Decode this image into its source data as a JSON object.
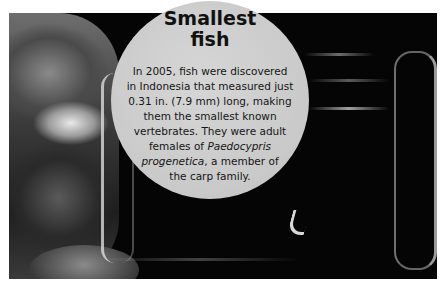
{
  "callout": {
    "title_line1": "Smallest",
    "title_line2": "fish",
    "body": [
      "In 2005, fish were discovered",
      "in Indonesia that measured just",
      "0.31 in. (7.9 mm) long, making",
      "them the smallest known",
      "vertebrates. They were adult",
      "females of ",
      "Paedocypris",
      "progenetica",
      ", a member of",
      "the carp family."
    ]
  },
  "photo": {
    "subject": "hand holding a glass jar containing a tiny fish",
    "colors": {
      "background": "#050505",
      "circle": "#cfcfcf",
      "text": "#111111"
    }
  }
}
